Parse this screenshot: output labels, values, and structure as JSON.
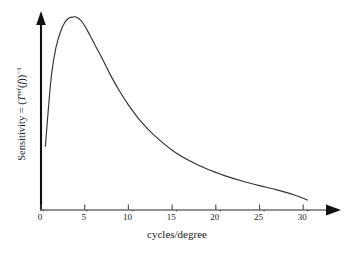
{
  "chart_data": {
    "type": "line",
    "title": "",
    "subtitle": "",
    "xlabel": "cycles/degree",
    "ylabel": "Sensitivity = (T^ref(f))^-1",
    "ylabel_parts": {
      "lead": "Sensitivity = (",
      "var_t": "T",
      "sup_ref": "ref",
      "open_paren": "(",
      "var_f": "f",
      "close_parens": "))",
      "sup_exp": "−1"
    },
    "xticks": [
      0,
      5,
      10,
      15,
      20,
      25,
      30
    ],
    "xtick_labels": [
      "0",
      "5",
      "10",
      "15",
      "20",
      "25",
      "30"
    ],
    "xtick_suffix": "′",
    "yticks": [],
    "ytick_labels": [],
    "xlim": [
      0,
      34
    ],
    "ylim": [
      0,
      1.08
    ],
    "grid": false,
    "legend": null,
    "axis_style": "arrow-headed L-frame",
    "line_color": "#333333",
    "axis_color": "#111111",
    "background_color": "#ffffff",
    "annotations": [],
    "series": [
      {
        "name": "Contrast sensitivity function",
        "description": "Band-pass sensitivity curve: rises steeply from low spatial frequency, peaks near 4 cycles/degree, then decays slowly toward 30 cycles/degree.",
        "peak_x": 4.0,
        "peak_y": 1.0,
        "start_x": 0.5,
        "start_y": 0.33,
        "end_x": 30.5,
        "end_y": 0.05,
        "x": [
          0.5,
          0.8,
          1.2,
          1.7,
          2.2,
          2.7,
          3.2,
          3.7,
          4.0,
          4.5,
          5.0,
          5.6,
          6.3,
          7.0,
          8.0,
          9.0,
          10.0,
          11.5,
          13.0,
          15.0,
          17.0,
          19.0,
          21.0,
          23.0,
          25.0,
          27.0,
          29.0,
          30.5
        ],
        "y": [
          0.33,
          0.5,
          0.7,
          0.84,
          0.92,
          0.97,
          0.995,
          1.0,
          1.0,
          0.985,
          0.955,
          0.905,
          0.845,
          0.785,
          0.695,
          0.615,
          0.545,
          0.455,
          0.385,
          0.31,
          0.255,
          0.212,
          0.178,
          0.15,
          0.126,
          0.104,
          0.078,
          0.052
        ]
      }
    ]
  },
  "figure": {
    "xaxis_title": "cycles/degree"
  }
}
